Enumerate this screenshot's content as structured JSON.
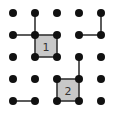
{
  "game": {
    "type": "dots-and-boxes",
    "grid": {
      "rows": 5,
      "cols": 5,
      "origin": [
        13,
        13
      ],
      "spacing": 22
    },
    "colors": {
      "dot": "#111111",
      "line": "#333333",
      "box_fill": "#c8c8c8",
      "background": "#ffffff"
    },
    "lines": [
      {
        "from": [
          1,
          0
        ],
        "to": [
          1,
          1
        ]
      },
      {
        "from": [
          0,
          1
        ],
        "to": [
          1,
          1
        ]
      },
      {
        "from": [
          1,
          1
        ],
        "to": [
          2,
          1
        ]
      },
      {
        "from": [
          1,
          1
        ],
        "to": [
          1,
          2
        ]
      },
      {
        "from": [
          2,
          1
        ],
        "to": [
          2,
          2
        ]
      },
      {
        "from": [
          1,
          2
        ],
        "to": [
          2,
          2
        ]
      },
      {
        "from": [
          4,
          0
        ],
        "to": [
          4,
          1
        ]
      },
      {
        "from": [
          3,
          1
        ],
        "to": [
          4,
          1
        ]
      },
      {
        "from": [
          3,
          2
        ],
        "to": [
          3,
          3
        ]
      },
      {
        "from": [
          2,
          3
        ],
        "to": [
          3,
          3
        ]
      },
      {
        "from": [
          2,
          3
        ],
        "to": [
          2,
          4
        ]
      },
      {
        "from": [
          3,
          3
        ],
        "to": [
          3,
          4
        ]
      },
      {
        "from": [
          2,
          4
        ],
        "to": [
          3,
          4
        ]
      },
      {
        "from": [
          0,
          4
        ],
        "to": [
          1,
          4
        ]
      }
    ],
    "boxes": [
      {
        "col": 1,
        "row": 1,
        "label": "1"
      },
      {
        "col": 2,
        "row": 3,
        "label": "2"
      }
    ]
  }
}
